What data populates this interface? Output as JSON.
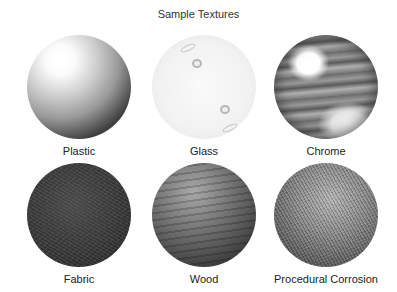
{
  "title": "Sample Textures",
  "textures": [
    {
      "name": "Plastic"
    },
    {
      "name": "Glass"
    },
    {
      "name": "Chrome"
    },
    {
      "name": "Fabric"
    },
    {
      "name": "Wood"
    },
    {
      "name": "Procedural Corrosion"
    }
  ]
}
